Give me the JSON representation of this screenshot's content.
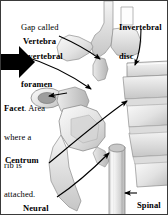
{
  "figure": {
    "background": "#ffffff",
    "border_color": "#3a3a3a",
    "text_color": "#000000"
  },
  "labels": {
    "foramen": {
      "line1": "Gap called",
      "line2": "invertebral",
      "line3": "foramen"
    },
    "disc": {
      "line1": "Invertebral",
      "line2": "disc"
    },
    "vertebra": {
      "text": "Vertebra"
    },
    "facet": {
      "term": "Facet",
      "line1_rest": ". Area",
      "line2": "where a",
      "line3": "rib is",
      "line4": "attached."
    },
    "centrum": {
      "text": "Centrum"
    },
    "neural_canal": {
      "line1": "Neural",
      "line2": "canal"
    },
    "spinal_cord": {
      "line1": "Spinal",
      "line2": "cord*"
    }
  },
  "icons": {
    "pointer_arrow": "block-arrow-right-icon",
    "leader_arrows": "leader-arrow-icon"
  }
}
